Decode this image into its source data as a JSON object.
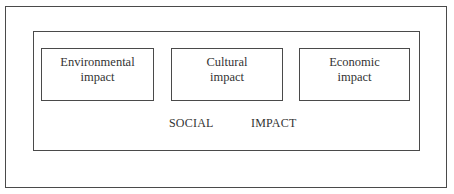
{
  "diagram": {
    "type": "nested-boxes",
    "outer_box": {
      "label": ""
    },
    "container": {
      "label_words": [
        "SOCIAL",
        "IMPACT"
      ]
    },
    "components": [
      {
        "lines": [
          "Environmental",
          "impact"
        ]
      },
      {
        "lines": [
          "Cultural",
          "impact"
        ]
      },
      {
        "lines": [
          "Economic",
          "impact"
        ]
      }
    ]
  },
  "colors": {
    "border": "#4a4a4a",
    "text": "#333333",
    "background": "#ffffff"
  }
}
